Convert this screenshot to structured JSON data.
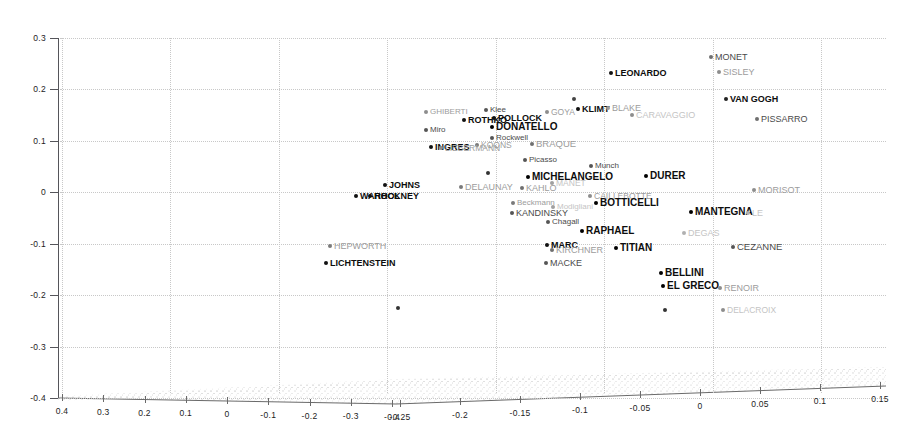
{
  "figure": {
    "type": "3d-scatter",
    "background": "#ffffff",
    "axis_color": "#55555a",
    "grid_color": "#c8c8c8"
  },
  "chart_data": {
    "type": "scatter",
    "title": "",
    "xlabel": "",
    "ylabel": "",
    "zlabel": "",
    "grid": true,
    "legend": "none",
    "projection": "3d",
    "y_axis": {
      "ticks": [
        "0.3",
        "0.2",
        "0.1",
        "0",
        "-0.1",
        "-0.2",
        "-0.3",
        "-0.4"
      ],
      "values": [
        0.3,
        0.2,
        0.1,
        0,
        -0.1,
        -0.2,
        -0.3,
        -0.4
      ],
      "range": [
        -0.4,
        0.3
      ]
    },
    "x_axis_left": {
      "ticks": [
        "0.4",
        "0.3",
        "0.2",
        "0.1",
        "0",
        "-0.1",
        "-0.2",
        "-0.3",
        "-0.4"
      ],
      "values": [
        0.4,
        0.3,
        0.2,
        0.1,
        0,
        -0.1,
        -0.2,
        -0.3,
        -0.4
      ],
      "range": [
        0.4,
        -0.4
      ]
    },
    "x_axis_right": {
      "ticks": [
        "-0.25",
        "-0.2",
        "-0.15",
        "-0.1",
        "-0.05",
        "0",
        "0.05",
        "0.1",
        "0.15"
      ],
      "values": [
        -0.25,
        -0.2,
        -0.15,
        -0.1,
        -0.05,
        0,
        0.05,
        0.1,
        0.15
      ],
      "range": [
        -0.25,
        0.15
      ]
    },
    "points": [
      {
        "label": "MONET",
        "px": 711,
        "py": 57,
        "emph": "mid",
        "size": 9,
        "dot": "#6f6f6f"
      },
      {
        "label": "LEONARDO",
        "px": 611,
        "py": 73,
        "emph": "bold",
        "size": 9,
        "dot": "#111111"
      },
      {
        "label": "SISLEY",
        "px": 719,
        "py": 72,
        "emph": "faint",
        "size": 9,
        "dot": "#8d8d8d"
      },
      {
        "label": "VAN GOGH",
        "px": 726,
        "py": 99,
        "emph": "bold",
        "size": 9,
        "dot": "#222222"
      },
      {
        "label": "PISSARRO",
        "px": 757,
        "py": 119,
        "emph": "mid",
        "size": 9,
        "dot": "#6f6f6f"
      },
      {
        "label": "KLIMT",
        "px": 578,
        "py": 109,
        "emph": "bold",
        "size": 9,
        "dot": "#111111"
      },
      {
        "label": "BLAKE",
        "px": 608,
        "py": 108,
        "emph": "faint",
        "size": 9,
        "dot": "#9a9a9a"
      },
      {
        "label": "CARAVAGGIO",
        "px": 632,
        "py": 115,
        "emph": "ghost",
        "size": 9,
        "dot": "#8d8d8d"
      },
      {
        "label": "GHIBERTI",
        "px": 426,
        "py": 112,
        "emph": "faint",
        "size": 8,
        "dot": "#8d8d8d"
      },
      {
        "label": "Klee",
        "px": 486,
        "py": 110,
        "emph": "mid",
        "size": 8,
        "dot": "#555555"
      },
      {
        "label": "GOYA",
        "px": 547,
        "py": 112,
        "emph": "faint",
        "size": 8.5,
        "dot": "#8d8d8d"
      },
      {
        "label": "ROTHKO",
        "px": 464,
        "py": 120,
        "emph": "bold",
        "size": 9,
        "dot": "#111111"
      },
      {
        "label": "POLLOCK",
        "px": 494,
        "py": 118,
        "emph": "bold",
        "size": 9,
        "dot": "#111111"
      },
      {
        "label": "DONATELLO",
        "px": 492,
        "py": 127,
        "emph": "bold",
        "size": 10,
        "dot": "#000000"
      },
      {
        "label": "Miro",
        "px": 426,
        "py": 130,
        "emph": "mid",
        "size": 8,
        "dot": "#555555"
      },
      {
        "label": "Rockwell",
        "px": 492,
        "py": 138,
        "emph": "mid",
        "size": 8,
        "dot": "#555555"
      },
      {
        "label": "KOONS",
        "px": 477,
        "py": 145,
        "emph": "faint",
        "size": 8.5,
        "dot": "#7a7a7a"
      },
      {
        "label": "INGRES",
        "px": 431,
        "py": 147,
        "emph": "bold",
        "size": 9,
        "dot": "#111111"
      },
      {
        "label": "LIEBERMANN",
        "px": 441,
        "py": 148,
        "emph": "faint",
        "size": 8.5,
        "dot": "#8d8d8d"
      },
      {
        "label": "BRAQUE",
        "px": 532,
        "py": 144,
        "emph": "faint",
        "size": 9.5,
        "dot": "#6f6f6f"
      },
      {
        "label": "Picasso",
        "px": 525,
        "py": 160,
        "emph": "mid",
        "size": 8,
        "dot": "#555555"
      },
      {
        "label": "Munch",
        "px": 591,
        "py": 166,
        "emph": "mid",
        "size": 8,
        "dot": "#555555"
      },
      {
        "label": "MICHELANGELO",
        "px": 528,
        "py": 177,
        "emph": "bold",
        "size": 10,
        "dot": "#000000"
      },
      {
        "label": "MANET",
        "px": 552,
        "py": 183,
        "emph": "ghost",
        "size": 8.5,
        "dot": "#a0a0a0"
      },
      {
        "label": "DURER",
        "px": 646,
        "py": 176,
        "emph": "bold",
        "size": 10,
        "dot": "#000000"
      },
      {
        "label": "MORISOT",
        "px": 754,
        "py": 190,
        "emph": "faint",
        "size": 9,
        "dot": "#8d8d8d"
      },
      {
        "label": "JOHNS",
        "px": 385,
        "py": 185,
        "emph": "bold",
        "size": 9,
        "dot": "#111111"
      },
      {
        "label": "HOCKNEY",
        "px": 370,
        "py": 196,
        "emph": "bold",
        "size": 9,
        "dot": "#111111"
      },
      {
        "label": "WARHOL",
        "px": 356,
        "py": 196,
        "emph": "bold",
        "size": 9,
        "dot": "#111111"
      },
      {
        "label": "DELAUNAY",
        "px": 461,
        "py": 187,
        "emph": "faint",
        "size": 9,
        "dot": "#7a7a7a"
      },
      {
        "label": "KAHLO",
        "px": 522,
        "py": 188,
        "emph": "faint",
        "size": 9,
        "dot": "#6f6f6f"
      },
      {
        "label": "CAILLEBOTTE",
        "px": 590,
        "py": 196,
        "emph": "faint",
        "size": 8.5,
        "dot": "#8d8d8d"
      },
      {
        "label": "BOTTICELLI",
        "px": 596,
        "py": 203,
        "emph": "bold",
        "size": 10,
        "dot": "#000000"
      },
      {
        "label": "Beckmann",
        "px": 513,
        "py": 203,
        "emph": "faint",
        "size": 8,
        "dot": "#7a7a7a"
      },
      {
        "label": "KANDINSKY",
        "px": 512,
        "py": 213,
        "emph": "mid",
        "size": 9,
        "dot": "#555555"
      },
      {
        "label": "Modigliani",
        "px": 553,
        "py": 207,
        "emph": "ghost",
        "size": 8,
        "dot": "#a0a0a0"
      },
      {
        "label": "Chagall",
        "px": 548,
        "py": 222,
        "emph": "mid",
        "size": 8,
        "dot": "#555555"
      },
      {
        "label": "MANTEGNA",
        "px": 691,
        "py": 212,
        "emph": "bold",
        "size": 10,
        "dot": "#000000"
      },
      {
        "label": "LE",
        "px": 748,
        "py": 213,
        "emph": "ghost",
        "size": 9,
        "dot": "#b0b0b0"
      },
      {
        "label": "RAPHAEL",
        "px": 582,
        "py": 231,
        "emph": "bold",
        "size": 10,
        "dot": "#000000"
      },
      {
        "label": "DEGAS",
        "px": 684,
        "py": 233,
        "emph": "ghost",
        "size": 9,
        "dot": "#b0b0b0"
      },
      {
        "label": "HEPWORTH",
        "px": 330,
        "py": 246,
        "emph": "faint",
        "size": 9,
        "dot": "#7a7a7a"
      },
      {
        "label": "MARC",
        "px": 547,
        "py": 245,
        "emph": "bold",
        "size": 9,
        "dot": "#111111"
      },
      {
        "label": "KIRCHNER",
        "px": 552,
        "py": 250,
        "emph": "faint",
        "size": 9,
        "dot": "#6f6f6f"
      },
      {
        "label": "TITIAN",
        "px": 616,
        "py": 248,
        "emph": "bold",
        "size": 10,
        "dot": "#000000"
      },
      {
        "label": "CEZANNE",
        "px": 733,
        "py": 247,
        "emph": "mid",
        "size": 9.5,
        "dot": "#555555"
      },
      {
        "label": "LICHTENSTEIN",
        "px": 326,
        "py": 263,
        "emph": "bold",
        "size": 9,
        "dot": "#111111"
      },
      {
        "label": "MACKE",
        "px": 546,
        "py": 263,
        "emph": "mid",
        "size": 9,
        "dot": "#555555"
      },
      {
        "label": "BELLINI",
        "px": 661,
        "py": 273,
        "emph": "bold",
        "size": 10,
        "dot": "#000000"
      },
      {
        "label": "EL GRECO",
        "px": 663,
        "py": 286,
        "emph": "bold",
        "size": 10,
        "dot": "#000000"
      },
      {
        "label": "RENOIR",
        "px": 720,
        "py": 288,
        "emph": "faint",
        "size": 9,
        "dot": "#8d8d8d"
      },
      {
        "label": "DELACROIX",
        "px": 723,
        "py": 310,
        "emph": "ghost",
        "size": 8.5,
        "dot": "#8d8d8d"
      },
      {
        "label": "",
        "px": 665,
        "py": 310,
        "emph": "none",
        "size": 8,
        "dot": "#333333"
      },
      {
        "label": "",
        "px": 488,
        "py": 173,
        "emph": "none",
        "size": 8,
        "dot": "#333333"
      },
      {
        "label": "",
        "px": 398,
        "py": 308,
        "emph": "none",
        "size": 8,
        "dot": "#333333"
      },
      {
        "label": "",
        "px": 574,
        "py": 99,
        "emph": "none",
        "size": 8,
        "dot": "#444444"
      }
    ]
  }
}
